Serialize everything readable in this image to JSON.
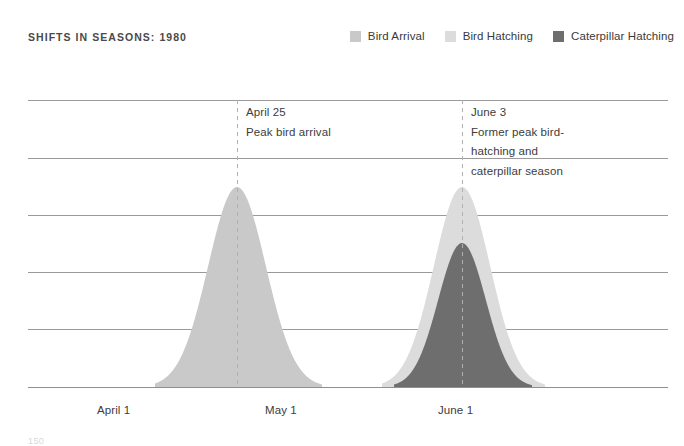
{
  "header": {
    "title": "SHIFTS IN SEASONS: 1980"
  },
  "legend": {
    "items": [
      {
        "label": "Bird Arrival",
        "color": "#c9c9c9",
        "icon": "legend-swatch-icon"
      },
      {
        "label": "Bird Hatching",
        "color": "#dcdcdc",
        "icon": "legend-swatch-icon"
      },
      {
        "label": "Caterpillar Hatching",
        "color": "#6e6e6e",
        "icon": "legend-swatch-icon"
      }
    ]
  },
  "annotations": [
    {
      "id": "ann-1",
      "lines": [
        "April 25",
        "Peak bird arrival"
      ],
      "marker_x_label": "April 25"
    },
    {
      "id": "ann-2",
      "lines": [
        "June 3",
        "Former peak bird-",
        "hatching and",
        "caterpillar season"
      ],
      "marker_x_label": "June 3"
    }
  ],
  "footer": {
    "note": "150"
  },
  "chart_data": {
    "type": "area",
    "title": "SHIFTS IN SEASONS: 1980",
    "xlabel": "",
    "ylabel": "",
    "grid": true,
    "legend_position": "top-right",
    "x_tick_labels": [
      "April 1",
      "May 1",
      "June 1"
    ],
    "x_tick_positions": [
      97,
      265,
      438
    ],
    "x_axis_range": [
      "April 1",
      "June 24"
    ],
    "gridlines_y": [
      100,
      158,
      215,
      272,
      329,
      387
    ],
    "baseline_y": 387,
    "plot_left": 28,
    "plot_right": 668,
    "markers": [
      {
        "label": "April 25",
        "x": 237,
        "style": "dashed-vertical",
        "color": "#b0b0b0"
      },
      {
        "label": "June 3",
        "x": 462,
        "style": "dashed-vertical",
        "color": "#b0b0b0"
      }
    ],
    "series": [
      {
        "name": "Bird Arrival",
        "color": "#c9c9c9",
        "peak_label": "April 25",
        "peak_x": 237,
        "peak_y": 187,
        "peak_value": 100,
        "base_start_x": 155,
        "base_end_x": 322,
        "shape": "bell-curve"
      },
      {
        "name": "Bird Hatching",
        "color": "#dcdcdc",
        "peak_label": "June 3",
        "peak_x": 462,
        "peak_y": 187,
        "peak_value": 100,
        "base_start_x": 382,
        "base_end_x": 545,
        "shape": "bell-curve"
      },
      {
        "name": "Caterpillar Hatching",
        "color": "#6e6e6e",
        "peak_label": "June 3",
        "peak_x": 462,
        "peak_y": 243,
        "peak_value": 72,
        "base_start_x": 394,
        "base_end_x": 532,
        "shape": "bell-curve"
      }
    ]
  }
}
